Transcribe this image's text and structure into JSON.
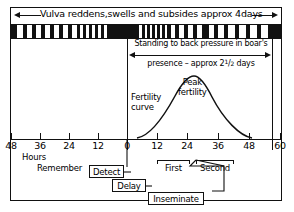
{
  "diagram": {
    "title_top": "Vulva reddens,swells and subsides approx 4days",
    "standing_line1": "Standing to back pressure in boar's",
    "standing_line2_prefix": "presence – approx 2",
    "standing_line2_frac_num": "1",
    "standing_line2_frac_den": "2",
    "standing_line2_suffix": " days",
    "fertility_curve_label_line1": "Fertility",
    "fertility_curve_label_line2": "curve",
    "peak_label_line1": "Peak",
    "peak_label_line2": "fertility",
    "axis_unit_label": "Hours",
    "axis_ticks": [
      {
        "value": "48",
        "x": 11
      },
      {
        "value": "36",
        "x": 40
      },
      {
        "value": "24",
        "x": 69
      },
      {
        "value": "12",
        "x": 98
      },
      {
        "value": "0",
        "x": 127
      },
      {
        "value": "12",
        "x": 157
      },
      {
        "value": "24",
        "x": 187
      },
      {
        "value": "36",
        "x": 218
      },
      {
        "value": "48",
        "x": 249
      },
      {
        "value": "60",
        "x": 280
      }
    ],
    "service_brackets": [
      {
        "label": "First",
        "left": 157,
        "width": 33
      },
      {
        "label": "Second",
        "left": 196,
        "width": 38
      }
    ],
    "process_boxes": [
      {
        "name": "detect",
        "label": "Detect"
      },
      {
        "name": "delay",
        "label": "Delay"
      },
      {
        "name": "inseminate",
        "label": "Inseminate"
      }
    ],
    "remember_label": "Remember",
    "chart_data": {
      "type": "line",
      "title": "Sow oestrus detection and insemination timing",
      "xlabel": "Hours",
      "ylabel": "Fertility",
      "xlim": [
        -48,
        60
      ],
      "ylim": [
        0,
        1
      ],
      "grid": false,
      "legend": "none",
      "series": [
        {
          "name": "Fertility curve",
          "x": [
            4,
            10,
            16,
            22,
            28,
            34,
            40,
            46,
            52,
            57
          ],
          "y": [
            0.0,
            0.25,
            0.55,
            0.82,
            0.97,
            0.95,
            0.75,
            0.47,
            0.18,
            0.0
          ]
        }
      ],
      "annotations": [
        {
          "text": "Peak fertility",
          "x": 26,
          "y": 0.95
        },
        {
          "text": "Fertility curve",
          "x": 2,
          "y": 0.55
        },
        {
          "text": "Standing to back pressure in boar's presence - approx 2 1/2 days",
          "x": 0,
          "y": 1.0
        },
        {
          "text": "Vulva reddens,swells and subsides approx 4days",
          "x": -48,
          "y": 1.2
        }
      ]
    }
  }
}
